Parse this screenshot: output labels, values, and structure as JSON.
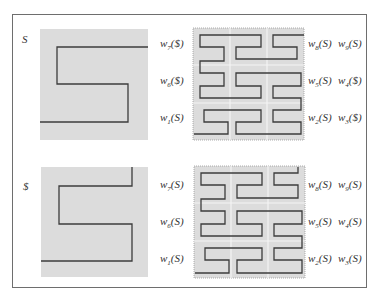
{
  "figure": {
    "panels": [
      {
        "id": "top",
        "source_label": "S",
        "left_labels": [
          {
            "w": "w",
            "sub": "7",
            "arg": "($)"
          },
          {
            "w": "w",
            "sub": "6",
            "arg": "($)"
          },
          {
            "w": "w",
            "sub": "1",
            "arg": "(S)"
          }
        ],
        "right_labels": [
          [
            {
              "w": "w",
              "sub": "8",
              "arg": "(S)"
            },
            {
              "w": "w",
              "sub": "9",
              "arg": "(S)"
            }
          ],
          [
            {
              "w": "w",
              "sub": "5",
              "arg": "(S)"
            },
            {
              "w": "w",
              "sub": "4",
              "arg": "($)"
            }
          ],
          [
            {
              "w": "w",
              "sub": "2",
              "arg": "(S)"
            },
            {
              "w": "w",
              "sub": "3",
              "arg": "($)"
            }
          ]
        ]
      },
      {
        "id": "bottom",
        "source_label": "$",
        "left_labels": [
          {
            "w": "w",
            "sub": "7",
            "arg": "(S)"
          },
          {
            "w": "w",
            "sub": "6",
            "arg": "(S)"
          },
          {
            "w": "w",
            "sub": "1",
            "arg": "(S)"
          }
        ],
        "right_labels": [
          [
            {
              "w": "w",
              "sub": "8",
              "arg": "(S)"
            },
            {
              "w": "w",
              "sub": "9",
              "arg": "(S)"
            }
          ],
          [
            {
              "w": "w",
              "sub": "5",
              "arg": "(S)"
            },
            {
              "w": "w",
              "sub": "4",
              "arg": "(S)"
            }
          ],
          [
            {
              "w": "w",
              "sub": "2",
              "arg": "(S)"
            },
            {
              "w": "w",
              "sub": "3",
              "arg": "(S)"
            }
          ]
        ]
      }
    ],
    "colors": {
      "box_fill": "#dcdcdc",
      "curve": "#3c3c3c",
      "frame": "#6e6e6e",
      "grid_line": "#f4f4f4",
      "dotted_border": "#999999"
    }
  }
}
